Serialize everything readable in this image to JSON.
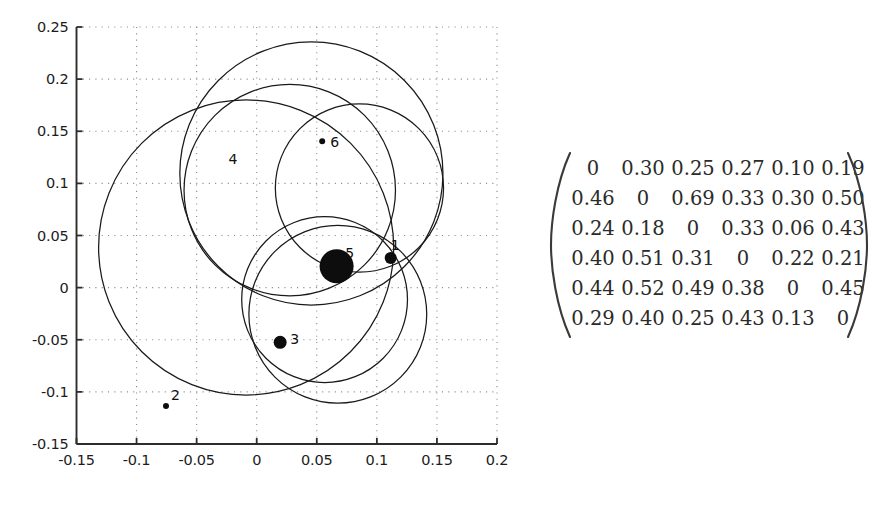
{
  "chart_data": {
    "type": "scatter",
    "title": "",
    "xlabel": "",
    "ylabel": "",
    "xlim": [
      -0.15,
      0.2
    ],
    "ylim": [
      -0.15,
      0.25
    ],
    "grid": true,
    "grid_style": "dotted",
    "legend": "none",
    "xticks": [
      "-0.15",
      "-0.1",
      "-0.05",
      "0",
      "0.05",
      "0.1",
      "0.15",
      "0.2"
    ],
    "xtick_values": [
      -0.15,
      -0.1,
      -0.05,
      0,
      0.05,
      0.1,
      0.15,
      0.2
    ],
    "yticks": [
      "0.25",
      "0.2",
      "0.15",
      "0.1",
      "0.05",
      "0",
      "-0.05",
      "-0.1",
      "-0.15"
    ],
    "ytick_values": [
      0.25,
      0.2,
      0.15,
      0.1,
      0.05,
      0,
      -0.05,
      -0.1,
      -0.15
    ],
    "points": [
      {
        "label": "1",
        "x": 0.1115,
        "y": 0.0285,
        "r": 6.0,
        "label_dx": 0,
        "label_dy": -13
      },
      {
        "label": "2",
        "x": -0.0755,
        "y": -0.1135,
        "r": 3.0,
        "label_dx": 5,
        "label_dy": -11
      },
      {
        "label": "3",
        "x": 0.0195,
        "y": -0.0525,
        "r": 6.5,
        "label_dx": 10,
        "label_dy": -3
      },
      {
        "label": "4",
        "x": 0.0665,
        "y": 0.0205,
        "r": 17.0,
        "label_dx": -108,
        "label_dy": -107
      },
      {
        "label": "5",
        "x": 0.0695,
        "y": 0.0235,
        "r": 9.0,
        "label_dx": 5,
        "label_dy": -10
      },
      {
        "label": "6",
        "x": 0.0545,
        "y": 0.1405,
        "r": 3.0,
        "label_dx": 8,
        "label_dy": 1
      }
    ],
    "circles": [
      {
        "name": "circle-1",
        "cx": -0.0088,
        "cy": 0.0385,
        "r": 0.1228
      },
      {
        "name": "circle-2",
        "cx": 0.0275,
        "cy": 0.0935,
        "r": 0.088
      },
      {
        "name": "circle-3",
        "cx": 0.0455,
        "cy": 0.1095,
        "r": 0.1095
      },
      {
        "name": "circle-4",
        "cx": 0.0675,
        "cy": -0.0255,
        "r": 0.074
      },
      {
        "name": "circle-5",
        "cx": 0.0855,
        "cy": 0.0955,
        "r": 0.07
      },
      {
        "name": "circle-6",
        "cx": 0.0565,
        "cy": -0.0115,
        "r": 0.069
      }
    ],
    "matrix": {
      "rows": [
        [
          "0",
          "0.30",
          "0.25",
          "0.27",
          "0.10",
          "0.19"
        ],
        [
          "0.46",
          "0",
          "0.69",
          "0.33",
          "0.30",
          "0.50"
        ],
        [
          "0.24",
          "0.18",
          "0",
          "0.33",
          "0.06",
          "0.43"
        ],
        [
          "0.40",
          "0.51",
          "0.31",
          "0",
          "0.22",
          "0.21"
        ],
        [
          "0.44",
          "0.52",
          "0.49",
          "0.38",
          "0",
          "0.45"
        ],
        [
          "0.29",
          "0.40",
          "0.25",
          "0.43",
          "0.13",
          "0"
        ]
      ]
    },
    "colors": {
      "axis": "#2d2e2c",
      "grid": "#8c8c8c",
      "curve": "#1a1a1a",
      "marker": "#0d0d0d",
      "matrix_text": "#2b2c2a",
      "background": "#ffffff"
    }
  }
}
